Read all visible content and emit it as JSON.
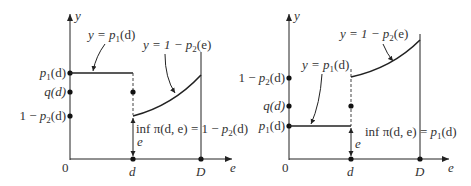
{
  "figures": [
    {
      "id": "left",
      "axis_labels": {
        "y": "y",
        "x": "e",
        "origin": "0"
      },
      "x_ticks": [
        {
          "label": "d"
        },
        {
          "label": "D"
        }
      ],
      "y_points": [
        {
          "label_a": "p",
          "label_sub": "1",
          "label_b": "(d)"
        },
        {
          "label_a": "q(d)"
        },
        {
          "label_pre": "1 − ",
          "label_a": "p",
          "label_sub": "2",
          "label_b": "(d)"
        }
      ],
      "annotations": {
        "flat_line": {
          "pre": "y = ",
          "a": "p",
          "sub": "1",
          "b": "(d)"
        },
        "curve": {
          "pre": "y = 1 − ",
          "a": "p",
          "sub": "2",
          "b": "(e)"
        },
        "inf": {
          "pre": "inf π(d, e) = 1 − ",
          "a": "p",
          "sub": "2",
          "b": "(d)"
        },
        "gap": "e"
      }
    },
    {
      "id": "right",
      "axis_labels": {
        "y": "y",
        "x": "e",
        "origin": "0"
      },
      "x_ticks": [
        {
          "label": "d"
        },
        {
          "label": "D"
        }
      ],
      "y_points": [
        {
          "label_pre": "1 − ",
          "label_a": "p",
          "label_sub": "2",
          "label_b": "(d)"
        },
        {
          "label_a": "q(d)"
        },
        {
          "label_a": "p",
          "label_sub": "1",
          "label_b": "(d)"
        }
      ],
      "annotations": {
        "flat_line": {
          "pre": "y = ",
          "a": "p",
          "sub": "1",
          "b": "(d)"
        },
        "curve": {
          "pre": "y = 1 − ",
          "a": "p",
          "sub": "2",
          "b": "(e)"
        },
        "inf": {
          "pre": "inf π(d, e) = ",
          "a": "p",
          "sub": "1",
          "b": "(d)"
        },
        "gap": "e"
      }
    }
  ],
  "colors": {
    "ink": "#222222",
    "text": "#333333"
  }
}
